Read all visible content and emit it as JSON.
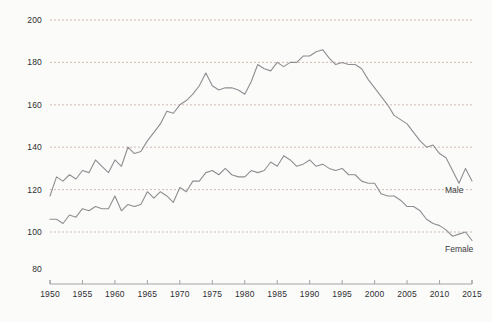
{
  "chart_data": {
    "type": "line",
    "title": "",
    "subtitle": "",
    "xlabel": "",
    "ylabel": "",
    "xlim": [
      1950,
      2015
    ],
    "ylim": [
      80,
      200
    ],
    "grid": true,
    "gridlines_y": [
      100,
      120,
      140,
      160,
      180,
      200
    ],
    "yticks": [
      80,
      100,
      120,
      140,
      160,
      180,
      200
    ],
    "ytick_labels": [
      "80",
      "100",
      "120",
      "140",
      "160",
      "180",
      "200"
    ],
    "xticks": [
      1950,
      1955,
      1960,
      1965,
      1970,
      1975,
      1980,
      1985,
      1990,
      1995,
      2000,
      2005,
      2010,
      2015
    ],
    "xtick_labels": [
      "1950",
      "1955",
      "1960",
      "1965",
      "1970",
      "1975",
      "1980",
      "1985",
      "1990",
      "1995",
      "2000",
      "2005",
      "2010",
      "2015"
    ],
    "legend_position": "inline-end-of-line",
    "x": [
      1950,
      1951,
      1952,
      1953,
      1954,
      1955,
      1956,
      1957,
      1958,
      1959,
      1960,
      1961,
      1962,
      1963,
      1964,
      1965,
      1966,
      1967,
      1968,
      1969,
      1970,
      1971,
      1972,
      1973,
      1974,
      1975,
      1976,
      1977,
      1978,
      1979,
      1980,
      1981,
      1982,
      1983,
      1984,
      1985,
      1986,
      1987,
      1988,
      1989,
      1990,
      1991,
      1992,
      1993,
      1994,
      1995,
      1996,
      1997,
      1998,
      1999,
      2000,
      2001,
      2002,
      2003,
      2004,
      2005,
      2006,
      2007,
      2008,
      2009,
      2010,
      2011,
      2012,
      2013,
      2014,
      2015
    ],
    "series": [
      {
        "name": "Male",
        "color": "#8e8e93",
        "label": "Male",
        "label_value": 124,
        "values": [
          117,
          126,
          124,
          127,
          125,
          129,
          128,
          134,
          131,
          128,
          134,
          131,
          140,
          137,
          138,
          143,
          147,
          151,
          157,
          156,
          160,
          162,
          165,
          169,
          175,
          169,
          167,
          168,
          168,
          167,
          165,
          171,
          179,
          177,
          176,
          180,
          178,
          180,
          180,
          183,
          183,
          185,
          186,
          182,
          179,
          180,
          179,
          179,
          177,
          172,
          168,
          164,
          160,
          155,
          153,
          151,
          147,
          143,
          140,
          141,
          137,
          135,
          129,
          123,
          130,
          124
        ]
      },
      {
        "name": "Female",
        "color": "#8e8e93",
        "label": "Female",
        "label_value": 96,
        "values": [
          106,
          106,
          104,
          108,
          107,
          111,
          110,
          112,
          111,
          111,
          117,
          110,
          113,
          112,
          113,
          119,
          116,
          119,
          117,
          114,
          121,
          119,
          124,
          124,
          128,
          129,
          127,
          130,
          127,
          126,
          126,
          129,
          128,
          129,
          133,
          131,
          136,
          134,
          131,
          132,
          134,
          131,
          132,
          130,
          129,
          130,
          127,
          127,
          124,
          123,
          123,
          118,
          117,
          117,
          115,
          112,
          112,
          110,
          106,
          104,
          103,
          101,
          98,
          99,
          100,
          96
        ]
      }
    ]
  },
  "axis": {
    "y_axis_present": false,
    "x_axis_present": true
  }
}
